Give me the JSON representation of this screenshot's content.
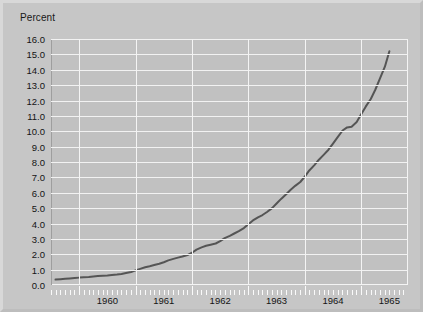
{
  "chart_data": {
    "type": "line",
    "title": "Percent",
    "xlabel": "",
    "ylabel": "Percent",
    "ylim": [
      0.0,
      16.0
    ],
    "ytick_step": 1.0,
    "yticks": [
      "16.0",
      "15.0",
      "14.0",
      "13.0",
      "12.0",
      "11.0",
      "10.0",
      "9.0",
      "8.0",
      "7.0",
      "6.0",
      "5.0",
      "4.0",
      "3.0",
      "2.0",
      "1.0",
      "0.0"
    ],
    "ytick_values": [
      16.0,
      15.0,
      14.0,
      13.0,
      12.0,
      11.0,
      10.0,
      9.0,
      8.0,
      7.0,
      6.0,
      5.0,
      4.0,
      3.0,
      2.0,
      1.0,
      0.0
    ],
    "xtick_labels": [
      "1960",
      "1961",
      "1962",
      "1963",
      "1964",
      "1965"
    ],
    "xtick_label_values": [
      1960.5,
      1961.5,
      1962.5,
      1963.5,
      1964.5,
      1965.5
    ],
    "xlim": [
      1959.5,
      1965.83
    ],
    "x_minor_interval": "month",
    "x_major_interval": "year",
    "grid": "horizontal-and-vertical",
    "legend": "none",
    "line_color": "#555555",
    "grid_color": "#f2f2f2",
    "plot_background": "#c1c1c1",
    "page_background": "#c6c6c6",
    "series": [
      {
        "name": "Percent",
        "x": [
          1959.58,
          1959.67,
          1959.75,
          1959.83,
          1959.92,
          1960.0,
          1960.08,
          1960.17,
          1960.25,
          1960.33,
          1960.42,
          1960.5,
          1960.58,
          1960.67,
          1960.75,
          1960.83,
          1960.92,
          1961.0,
          1961.08,
          1961.17,
          1961.25,
          1961.33,
          1961.42,
          1961.5,
          1961.58,
          1961.67,
          1961.75,
          1961.83,
          1961.92,
          1962.0,
          1962.08,
          1962.17,
          1962.25,
          1962.33,
          1962.42,
          1962.5,
          1962.58,
          1962.67,
          1962.75,
          1962.83,
          1962.92,
          1963.0,
          1963.08,
          1963.17,
          1963.25,
          1963.33,
          1963.42,
          1963.5,
          1963.58,
          1963.67,
          1963.75,
          1963.83,
          1963.92,
          1964.0,
          1964.08,
          1964.17,
          1964.25,
          1964.33,
          1964.42,
          1964.5,
          1964.58,
          1964.67,
          1964.75,
          1964.83,
          1964.92,
          1965.0,
          1965.08,
          1965.17,
          1965.25,
          1965.33,
          1965.42,
          1965.5
        ],
        "values": [
          0.35,
          0.38,
          0.4,
          0.42,
          0.45,
          0.48,
          0.5,
          0.52,
          0.55,
          0.58,
          0.6,
          0.62,
          0.65,
          0.68,
          0.72,
          0.78,
          0.85,
          0.95,
          1.05,
          1.15,
          1.22,
          1.3,
          1.38,
          1.48,
          1.6,
          1.7,
          1.78,
          1.85,
          1.95,
          2.1,
          2.3,
          2.45,
          2.55,
          2.62,
          2.7,
          2.85,
          3.05,
          3.2,
          3.35,
          3.5,
          3.7,
          3.95,
          4.2,
          4.4,
          4.55,
          4.75,
          5.0,
          5.3,
          5.6,
          5.9,
          6.2,
          6.45,
          6.7,
          7.05,
          7.45,
          7.8,
          8.15,
          8.45,
          8.8,
          9.2,
          9.6,
          10.05,
          10.25,
          10.3,
          10.6,
          11.1,
          11.6,
          12.1,
          12.7,
          13.4,
          14.2,
          15.2
        ]
      }
    ]
  }
}
